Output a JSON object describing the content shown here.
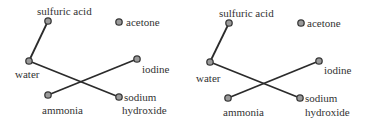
{
  "diagrams": [
    {
      "nodes": {
        "sulfuric_acid": {
          "label": "sulfuric acid",
          "x": 48,
          "y": 21,
          "lx": 37,
          "ly": 15,
          "anchor": "start"
        },
        "acetone": {
          "label": "acetone",
          "x": 119,
          "y": 22,
          "lx": 126,
          "ly": 26,
          "anchor": "start"
        },
        "water": {
          "label": "water",
          "x": 29,
          "y": 61,
          "lx": 15,
          "ly": 78,
          "anchor": "start"
        },
        "iodine": {
          "label": "iodine",
          "x": 137,
          "y": 59,
          "lx": 142,
          "ly": 73,
          "anchor": "start"
        },
        "ammonia": {
          "label": "ammonia",
          "x": 48,
          "y": 95,
          "lx": 42,
          "ly": 114,
          "anchor": "start"
        },
        "sodium_hydroxide": {
          "label": "sodium",
          "label2": "hydroxide",
          "x": 119,
          "y": 97,
          "lx": 124,
          "ly": 101,
          "lx2": 122,
          "ly2": 114,
          "anchor": "start"
        }
      },
      "edges": [
        [
          "sulfuric_acid",
          "water"
        ],
        [
          "water",
          "sodium_hydroxide"
        ],
        [
          "ammonia",
          "iodine"
        ]
      ]
    },
    {
      "nodes": {
        "sulfuric_acid": {
          "label": "sulfuric acid",
          "x": 229,
          "y": 23,
          "lx": 219,
          "ly": 17,
          "anchor": "start"
        },
        "acetone": {
          "label": "acetone",
          "x": 301,
          "y": 23,
          "lx": 307,
          "ly": 27,
          "anchor": "start"
        },
        "water": {
          "label": "water",
          "x": 210,
          "y": 62,
          "lx": 196,
          "ly": 82,
          "anchor": "start"
        },
        "iodine": {
          "label": "iodine",
          "x": 319,
          "y": 61,
          "lx": 324,
          "ly": 74,
          "anchor": "start"
        },
        "ammonia": {
          "label": "ammonia",
          "x": 228,
          "y": 98,
          "lx": 223,
          "ly": 116,
          "anchor": "start"
        },
        "sodium_hydroxide": {
          "label": "sodium",
          "label2": "hydroxide",
          "x": 300,
          "y": 98,
          "lx": 305,
          "ly": 102,
          "lx2": 305,
          "ly2": 116,
          "anchor": "start"
        }
      },
      "edges": [
        [
          "sulfuric_acid",
          "water"
        ],
        [
          "water",
          "sodium_hydroxide"
        ],
        [
          "ammonia",
          "iodine"
        ]
      ]
    }
  ]
}
